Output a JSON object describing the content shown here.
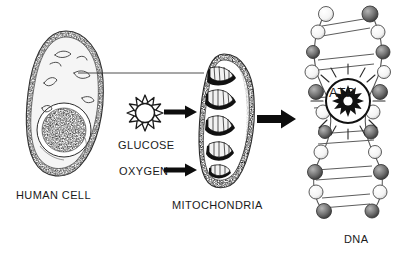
{
  "diagram": {
    "background_color": "#ffffff",
    "ink_color": "#1a1a1a",
    "width": 406,
    "height": 265
  },
  "labels": {
    "human_cell": "HUMAN CELL",
    "glucose": "GLUCOSE",
    "oxygen": "OXYGEN",
    "mitochondria": "MITOCHONDRIA",
    "atp": "ATP",
    "dna": "DNA"
  },
  "figures": {
    "human_cell": {
      "name": "human-cell-illustration",
      "description": "Oval cell with stippled membrane, nucleus and small organelles"
    },
    "glucose": {
      "name": "glucose-sunburst-icon",
      "description": "Twelve-pointed star outline representing a glucose molecule",
      "points": 12,
      "fill": "#ffffff"
    },
    "mitochondria": {
      "name": "mitochondria-illustration",
      "description": "Elongated organelle with internal cristae folds",
      "cristae_count": 6
    },
    "atp": {
      "name": "atp-burst-icon",
      "description": "Filled sunburst inside a circle with radiating rays",
      "points": 12,
      "fill": "#1a1a1a"
    },
    "dna": {
      "name": "dna-double-helix-illustration",
      "description": "Double helix ladder with alternating light and shaded spheres",
      "rungs": 7
    }
  },
  "connectors": {
    "leader_line": {
      "name": "cell-to-mitochondria-leader-line",
      "description": "Thin horizontal line linking an organelle in the cell to the mitochondria"
    },
    "arrow_glucose": {
      "name": "glucose-input-arrow",
      "direction": "right"
    },
    "arrow_oxygen": {
      "name": "oxygen-input-arrow",
      "direction": "right"
    },
    "arrow_mitochondria_to_atp": {
      "name": "mitochondria-to-atp-arrow",
      "direction": "right"
    }
  }
}
